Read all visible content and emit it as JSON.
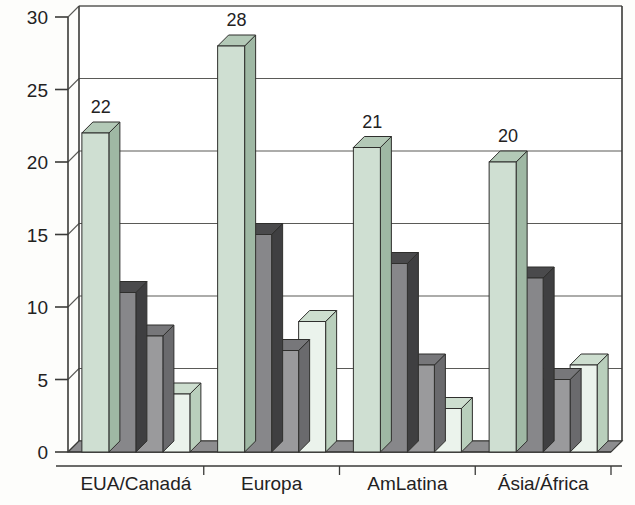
{
  "chart_data": {
    "type": "bar",
    "title": "",
    "subtitle": "",
    "xlabel": "",
    "ylabel": "",
    "ylim": [
      0,
      30
    ],
    "yticks": [
      0,
      5,
      10,
      15,
      20,
      25,
      30
    ],
    "ytick_labels": [
      "0",
      "5",
      "10",
      "15",
      "20",
      "25",
      "30"
    ],
    "grid": true,
    "legend": "none",
    "three_d": true,
    "categories": [
      "EUA/Canadá",
      "Europa",
      "AmLatina",
      "Ásia/África"
    ],
    "series": [
      {
        "name": "serie-1",
        "values": [
          22,
          28,
          21,
          20
        ],
        "color": "#cfdfd2"
      },
      {
        "name": "serie-2",
        "values": [
          11,
          15,
          13,
          12
        ],
        "color": "#87878a"
      },
      {
        "name": "serie-3",
        "values": [
          8,
          7,
          6,
          5
        ],
        "color": "#9a9a9c"
      },
      {
        "name": "serie-4",
        "values": [
          4,
          9,
          3,
          6
        ],
        "color": "#ebf3ec"
      }
    ],
    "data_labels": {
      "series": "serie-1",
      "values": [
        "22",
        "28",
        "21",
        "20"
      ]
    },
    "colors": {
      "background": "#fdfdfb",
      "axis": "#3a3a38",
      "gridline": "#5a5a57",
      "text": "#23221f",
      "floor": "#8d8d8f",
      "series1_front": "#cfdfd2",
      "series1_top": "#b3c9b7",
      "series1_side": "#9fb8a4",
      "series2_front": "#87878a",
      "series2_top": "#4a4a4c",
      "series2_side": "#3f3f41",
      "series3_front": "#9a9a9c",
      "series3_top": "#77777a",
      "series3_side": "#6a6a6d",
      "series4_front": "#ebf3ec",
      "series4_top": "#cddecf",
      "series4_side": "#b9cfbc"
    }
  }
}
